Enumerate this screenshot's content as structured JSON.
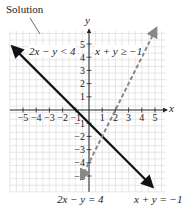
{
  "annotation": {
    "solution_label": "Solution"
  },
  "labels": {
    "ineq1": "2x − y < 4",
    "ineq2": "x + y ≥ −1",
    "eq1": "2x − y = 4",
    "eq2": "x + y = −1",
    "x_axis": "x",
    "y_axis": "y"
  },
  "chart_data": {
    "type": "line",
    "title": "",
    "xlabel": "x",
    "ylabel": "y",
    "xlim": [
      -6,
      6
    ],
    "ylim": [
      -6,
      6
    ],
    "grid": true,
    "grid_step": 0.5,
    "x_ticks": [
      -5,
      -4,
      -3,
      -2,
      -1,
      1,
      2,
      3,
      4,
      5
    ],
    "y_ticks": [
      -5,
      -4,
      -3,
      -2,
      -1,
      1,
      2,
      3,
      4,
      5
    ],
    "series": [
      {
        "name": "x + y = −1",
        "style": "solid",
        "color": "#111111",
        "x": [
          -5.8,
          4.8
        ],
        "y": [
          4.8,
          -5.8
        ]
      },
      {
        "name": "2x − y = 4",
        "style": "dashed",
        "color": "#888888",
        "x": [
          -0.6,
          5.1
        ],
        "y": [
          -5.2,
          6.2
        ]
      }
    ],
    "annotations": [
      {
        "text": "Solution",
        "points_to": "region 2x − y < 4 and x + y ≥ −1"
      },
      {
        "text": "2x − y < 4",
        "region": "upper-left"
      },
      {
        "text": "x + y ≥ −1",
        "region": "upper-right"
      },
      {
        "text": "2x − y = 4",
        "target": "dashed line"
      },
      {
        "text": "x + y = −1",
        "target": "solid line"
      }
    ]
  }
}
